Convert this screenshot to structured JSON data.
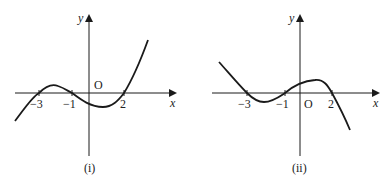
{
  "figures": [
    {
      "id": "i",
      "caption": "(i)",
      "x_axis_label": "x",
      "y_axis_label": "y",
      "origin_label": "O",
      "tick_labels": [
        "−3",
        "−1",
        "2"
      ],
      "roots": [
        -3,
        -1,
        2
      ],
      "description": "Cubic with positive leading coefficient crossing x-axis at -3, -1, 2"
    },
    {
      "id": "ii",
      "caption": "(ii)",
      "x_axis_label": "x",
      "y_axis_label": "y",
      "origin_label": "O",
      "tick_labels": [
        "−3",
        "−1",
        "2"
      ],
      "roots": [
        -3,
        -1,
        2
      ],
      "description": "Cubic with negative leading coefficient crossing x-axis at -3, -1, 2"
    }
  ],
  "colors": {
    "stroke": "#1a1a1a",
    "background": "#ffffff"
  }
}
